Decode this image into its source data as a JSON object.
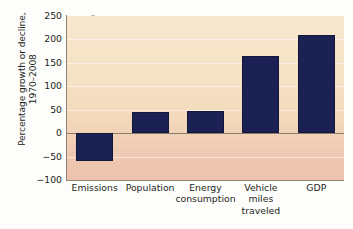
{
  "chart_data": {
    "type": "bar",
    "title": "",
    "subtitle": "",
    "xlabel": "",
    "ylabel": "Percentage growth or decline,\n1970–2008",
    "categories": [
      "Emissions",
      "Population",
      "Energy\nconsumption",
      "Vehicle\nmiles\ntraveled",
      "GDP"
    ],
    "values": [
      -60,
      46,
      48,
      165,
      210
    ],
    "ylim": [
      -100,
      250
    ],
    "ytick_step": 50,
    "ytick_labels": [
      "250",
      "200",
      "150",
      "100",
      "50",
      "0",
      "−50",
      "−100"
    ],
    "ytick_values": [
      250,
      200,
      150,
      100,
      50,
      0,
      -50,
      -100
    ],
    "grid": true,
    "legend": false,
    "legend_position": "none",
    "series": [
      {
        "name": "Percentage growth or decline, 1970–2008",
        "values": [
          -60,
          46,
          48,
          165,
          210
        ]
      }
    ],
    "colors": {
      "bar": "#1b2153",
      "bar_edge": "#11163b",
      "plot_bg_top": "#f7e7cd",
      "plot_bg_bottom": "#eec2ac",
      "axis": "#8f8070",
      "zero_line": "#8a7c6d",
      "gridline": "#ffffff",
      "text": "#231f20",
      "page_bg": "#fdfdfb"
    }
  }
}
